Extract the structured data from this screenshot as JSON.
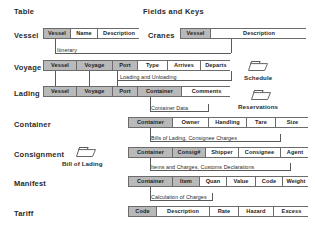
{
  "diagram": {
    "headings": [
      {
        "name": "table-column-heading",
        "label": "Table",
        "x": 14,
        "y": 7
      },
      {
        "name": "fields-and-keys-heading",
        "label": "Fields and Keys",
        "x": 143,
        "y": 7
      }
    ],
    "entities": [
      {
        "name": "vessel",
        "label": "Vessel",
        "label_x": 14,
        "label_y": 31,
        "box_x": 43,
        "box_y": 28,
        "box_w": 96,
        "fields": [
          {
            "label": "Vessel",
            "key": true,
            "w": 27
          },
          {
            "label": "Name",
            "key": false,
            "w": 27
          },
          {
            "label": "Description",
            "key": false,
            "w": 42
          }
        ]
      },
      {
        "name": "cranes",
        "label": "Cranes",
        "label_x": 148,
        "label_y": 31,
        "box_x": 180,
        "box_y": 28,
        "box_w": 126,
        "fields": [
          {
            "label": "Vessel",
            "key": true,
            "w": 30
          },
          {
            "label": "Description",
            "key": false,
            "w": 96
          }
        ]
      },
      {
        "name": "voyage",
        "label": "Voyage",
        "label_x": 14,
        "label_y": 63,
        "box_x": 43,
        "box_y": 60,
        "box_w": 187,
        "fields": [
          {
            "label": "Vessel",
            "key": true,
            "w": 33
          },
          {
            "label": "Voyage",
            "key": true,
            "w": 36
          },
          {
            "label": "Port",
            "key": true,
            "w": 25
          },
          {
            "label": "Type",
            "key": false,
            "w": 30
          },
          {
            "label": "Arrives",
            "key": false,
            "w": 33
          },
          {
            "label": "Departs",
            "key": false,
            "w": 30
          }
        ]
      },
      {
        "name": "lading",
        "label": "Lading",
        "label_x": 14,
        "label_y": 89,
        "box_x": 43,
        "box_y": 86,
        "box_w": 187,
        "fields": [
          {
            "label": "Vessel",
            "key": true,
            "w": 33
          },
          {
            "label": "Voyage",
            "key": true,
            "w": 36
          },
          {
            "label": "Port",
            "key": true,
            "w": 25
          },
          {
            "label": "Container",
            "key": true,
            "w": 44
          },
          {
            "label": "Comments",
            "key": false,
            "w": 49
          }
        ]
      },
      {
        "name": "container",
        "label": "Container",
        "label_x": 14,
        "label_y": 120,
        "box_x": 128,
        "box_y": 117,
        "box_w": 180,
        "fields": [
          {
            "label": "Container",
            "key": true,
            "w": 44
          },
          {
            "label": "Owner",
            "key": false,
            "w": 36
          },
          {
            "label": "Handling",
            "key": false,
            "w": 38
          },
          {
            "label": "Tare",
            "key": false,
            "w": 29
          },
          {
            "label": "Size",
            "key": false,
            "w": 33
          }
        ]
      },
      {
        "name": "consignment",
        "label": "Consignment",
        "label_x": 14,
        "label_y": 150,
        "box_x": 128,
        "box_y": 147,
        "box_w": 180,
        "fields": [
          {
            "label": "Container",
            "key": true,
            "w": 44
          },
          {
            "label": "Consig#",
            "key": true,
            "w": 33
          },
          {
            "label": "Shipper",
            "key": false,
            "w": 33
          },
          {
            "label": "Consignee",
            "key": false,
            "w": 42
          },
          {
            "label": "Agent",
            "key": false,
            "w": 28
          }
        ]
      },
      {
        "name": "manifest",
        "label": "Manifest",
        "label_x": 14,
        "label_y": 179,
        "box_x": 128,
        "box_y": 176,
        "box_w": 180,
        "fields": [
          {
            "label": "Container",
            "key": true,
            "w": 44
          },
          {
            "label": "Item",
            "key": true,
            "w": 27
          },
          {
            "label": "Quan",
            "key": false,
            "w": 27
          },
          {
            "label": "Value",
            "key": false,
            "w": 29
          },
          {
            "label": "Code",
            "key": false,
            "w": 27
          },
          {
            "label": "Weight",
            "key": false,
            "w": 26
          }
        ]
      },
      {
        "name": "tariff",
        "label": "Tariff",
        "label_x": 14,
        "label_y": 209,
        "box_x": 128,
        "box_y": 206,
        "box_w": 180,
        "fields": [
          {
            "label": "Code",
            "key": true,
            "w": 28
          },
          {
            "label": "Description",
            "key": false,
            "w": 53
          },
          {
            "label": "Rate",
            "key": false,
            "w": 29
          },
          {
            "label": "Hazard",
            "key": false,
            "w": 35
          },
          {
            "label": "Excess",
            "key": false,
            "w": 35
          }
        ]
      }
    ],
    "relationships": [
      {
        "name": "itinerary-caption",
        "label": "Itinerary",
        "x": 57,
        "y": 47
      },
      {
        "name": "loading-unloading-caption",
        "label": "Loading and Unloading",
        "x": 120,
        "y": 74
      },
      {
        "name": "container-data-caption",
        "label": "Container Data",
        "x": 151,
        "y": 105
      },
      {
        "name": "bills-of-lading-caption",
        "label": "Bills of Lading, Consignee Charges",
        "x": 151,
        "y": 135
      },
      {
        "name": "items-charges-caption",
        "label": "Items and Charges, Customs Declarations",
        "x": 151,
        "y": 164
      },
      {
        "name": "calculation-of-charges-caption",
        "label": "Calculation of Charges",
        "x": 151,
        "y": 194
      }
    ],
    "connectors": [
      {
        "name": "vessel-to-itinerary-v",
        "o": "v",
        "x": 55,
        "y": 39,
        "len": 14
      },
      {
        "name": "itinerary-to-voyage-h",
        "o": "h",
        "x": 55,
        "y": 53,
        "len": 176
      },
      {
        "name": "cranes-drop-v",
        "o": "v",
        "x": 231,
        "y": 39,
        "len": 14
      },
      {
        "name": "voyage-v1",
        "o": "v",
        "x": 55,
        "y": 71,
        "len": 15
      },
      {
        "name": "voyage-v2",
        "o": "v",
        "x": 89,
        "y": 71,
        "len": 15
      },
      {
        "name": "voyage-v3",
        "o": "v",
        "x": 117,
        "y": 71,
        "len": 15
      },
      {
        "name": "loading-line-h",
        "o": "h",
        "x": 117,
        "y": 80,
        "len": 114
      },
      {
        "name": "loading-drop-v",
        "o": "v",
        "x": 231,
        "y": 71,
        "len": 10
      },
      {
        "name": "lading-container-v",
        "o": "v",
        "x": 150,
        "y": 97,
        "len": 14
      },
      {
        "name": "container-data-h",
        "o": "h",
        "x": 150,
        "y": 111,
        "len": 58
      },
      {
        "name": "container-data-drop-v",
        "o": "v",
        "x": 208,
        "y": 104,
        "len": 8
      },
      {
        "name": "container-down-v",
        "o": "v",
        "x": 150,
        "y": 128,
        "len": 13
      },
      {
        "name": "bills-h",
        "o": "h",
        "x": 150,
        "y": 141,
        "len": 130
      },
      {
        "name": "bills-drop-v",
        "o": "v",
        "x": 280,
        "y": 134,
        "len": 8
      },
      {
        "name": "consignment-down-v",
        "o": "v",
        "x": 150,
        "y": 158,
        "len": 12
      },
      {
        "name": "items-h",
        "o": "h",
        "x": 150,
        "y": 170,
        "len": 140
      },
      {
        "name": "items-drop-v",
        "o": "v",
        "x": 290,
        "y": 163,
        "len": 8
      },
      {
        "name": "manifest-down-v",
        "o": "v",
        "x": 150,
        "y": 187,
        "len": 13
      },
      {
        "name": "calculation-h",
        "o": "h",
        "x": 150,
        "y": 200,
        "len": 62
      },
      {
        "name": "calculation-drop-v",
        "o": "v",
        "x": 212,
        "y": 193,
        "len": 8
      }
    ],
    "folders": [
      {
        "name": "schedule-folder",
        "label": "Schedule",
        "icon": "folder-icon",
        "x": 247,
        "y": 59,
        "label_x": 244,
        "label_y": 74
      },
      {
        "name": "reservations-folder",
        "label": "Reservations",
        "icon": "folder-icon",
        "x": 250,
        "y": 88,
        "label_x": 238,
        "label_y": 103
      },
      {
        "name": "bill-of-lading-folder",
        "label": "Bill of Lading",
        "icon": "folder-icon",
        "x": 75,
        "y": 145,
        "label_x": 62,
        "label_y": 160
      }
    ],
    "colors": {
      "key_field_fill": "#b9b9b9",
      "field_fill": "#ffffff",
      "border": "#6b6b6b",
      "text": "#1c1c1c"
    }
  }
}
